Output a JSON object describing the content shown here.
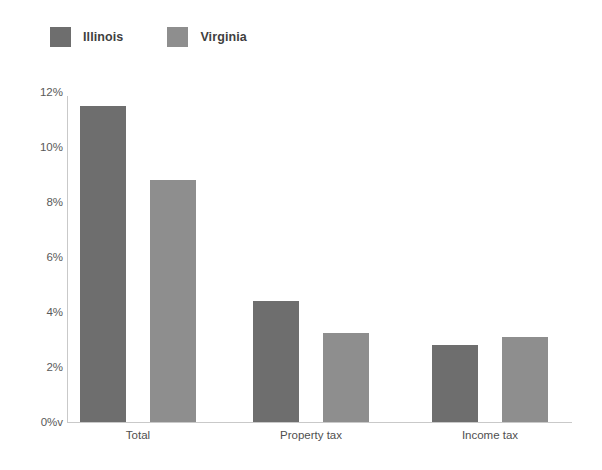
{
  "legend": {
    "items": [
      {
        "label": "Illinois",
        "color": "#6e6e6e"
      },
      {
        "label": "Virginia",
        "color": "#8e8e8e"
      }
    ]
  },
  "axis": {
    "yticks": [
      "12%",
      "10%",
      "8%",
      "6%",
      "4%",
      "2%",
      "0%v"
    ]
  },
  "chart_data": {
    "type": "bar",
    "title": "",
    "subtitle": "",
    "xlabel": "",
    "ylabel": "",
    "categories": [
      "Total",
      "Property tax",
      "Income tax"
    ],
    "series": [
      {
        "name": "Illinois",
        "color": "#6e6e6e",
        "values": [
          11.5,
          4.4,
          2.8
        ]
      },
      {
        "name": "Virginia",
        "color": "#8e8e8e",
        "values": [
          8.8,
          3.25,
          3.1
        ]
      }
    ],
    "ylim": [
      0,
      12
    ],
    "ytick_values": [
      12,
      10,
      8,
      6,
      4,
      2,
      0
    ],
    "ytick_labels": [
      "12%",
      "10%",
      "8%",
      "6%",
      "4%",
      "2%",
      "0%v"
    ],
    "grid": false,
    "legend_position": "top-left",
    "value_unit": "percent"
  }
}
